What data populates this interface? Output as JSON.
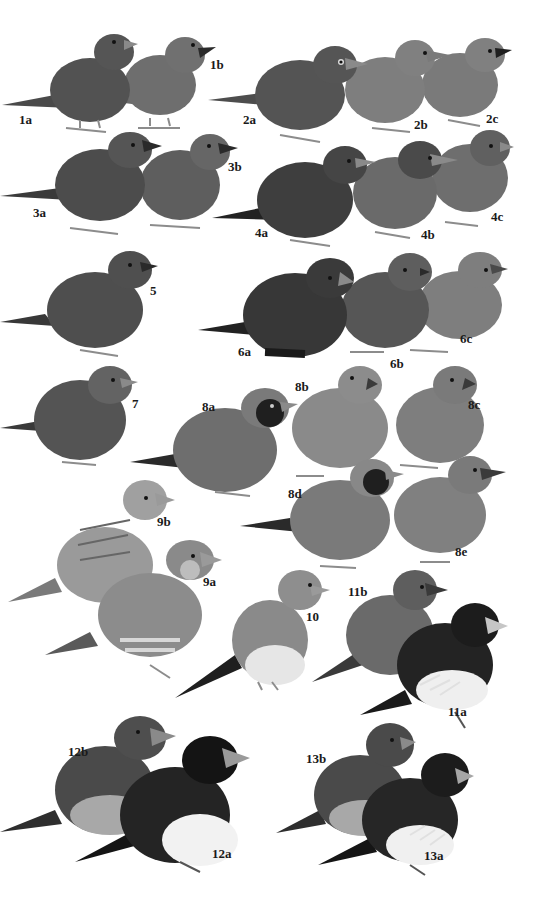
{
  "plate": {
    "width": 555,
    "height": 908,
    "background": "#ffffff"
  },
  "labels": [
    {
      "id": "1a",
      "text": "1a",
      "x": 19,
      "y": 113
    },
    {
      "id": "1b",
      "text": "1b",
      "x": 210,
      "y": 58
    },
    {
      "id": "2a",
      "text": "2a",
      "x": 243,
      "y": 113
    },
    {
      "id": "2b",
      "text": "2b",
      "x": 414,
      "y": 118
    },
    {
      "id": "2c",
      "text": "2c",
      "x": 486,
      "y": 112
    },
    {
      "id": "3a",
      "text": "3a",
      "x": 33,
      "y": 206
    },
    {
      "id": "3b",
      "text": "3b",
      "x": 228,
      "y": 160
    },
    {
      "id": "4a",
      "text": "4a",
      "x": 255,
      "y": 226
    },
    {
      "id": "4b",
      "text": "4b",
      "x": 421,
      "y": 228
    },
    {
      "id": "4c",
      "text": "4c",
      "x": 491,
      "y": 210
    },
    {
      "id": "5",
      "text": "5",
      "x": 150,
      "y": 284
    },
    {
      "id": "6a",
      "text": "6a",
      "x": 238,
      "y": 345
    },
    {
      "id": "6b",
      "text": "6b",
      "x": 390,
      "y": 357
    },
    {
      "id": "6c",
      "text": "6c",
      "x": 460,
      "y": 332
    },
    {
      "id": "7",
      "text": "7",
      "x": 132,
      "y": 397
    },
    {
      "id": "8a",
      "text": "8a",
      "x": 202,
      "y": 400
    },
    {
      "id": "8b",
      "text": "8b",
      "x": 295,
      "y": 380
    },
    {
      "id": "8c",
      "text": "8c",
      "x": 468,
      "y": 398
    },
    {
      "id": "8d",
      "text": "8d",
      "x": 288,
      "y": 487
    },
    {
      "id": "8e",
      "text": "8e",
      "x": 455,
      "y": 545
    },
    {
      "id": "9b",
      "text": "9b",
      "x": 157,
      "y": 515
    },
    {
      "id": "9a",
      "text": "9a",
      "x": 203,
      "y": 575
    },
    {
      "id": "10",
      "text": "10",
      "x": 306,
      "y": 610
    },
    {
      "id": "11b",
      "text": "11b",
      "x": 348,
      "y": 585
    },
    {
      "id": "11a",
      "text": "11a",
      "x": 448,
      "y": 705
    },
    {
      "id": "12b",
      "text": "12b",
      "x": 68,
      "y": 745
    },
    {
      "id": "12a",
      "text": "12a",
      "x": 212,
      "y": 847
    },
    {
      "id": "13b",
      "text": "13b",
      "x": 306,
      "y": 752
    },
    {
      "id": "13a",
      "text": "13a",
      "x": 424,
      "y": 849
    }
  ],
  "colors": {
    "dark": "#3a3a3a",
    "mid_dark": "#4e4e4e",
    "mid": "#636363",
    "light": "#7d7d7d",
    "pale": "#9a9a9a",
    "black": "#1a1a1a",
    "white_belly": "#efefef",
    "beak": "#8a8a8a",
    "legs": "#8c8c8c"
  }
}
